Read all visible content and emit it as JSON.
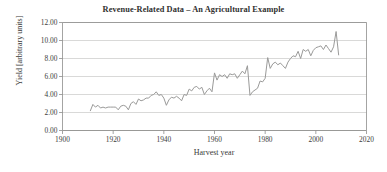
{
  "chart_data": {
    "type": "line",
    "title": "Revenue-Related Data – An Agricultural Example",
    "xlabel": "Harvest year",
    "ylabel": "Yield [arbitrary units]",
    "xlim": [
      1900,
      2020
    ],
    "ylim": [
      0,
      12
    ],
    "xticks": [
      1900,
      1920,
      1940,
      1960,
      1980,
      2000,
      2020
    ],
    "xtick_labels": [
      "1900",
      "1920",
      "1940",
      "1960",
      "1980",
      "2000",
      "2020"
    ],
    "yticks": [
      0,
      2,
      4,
      6,
      8,
      10,
      12
    ],
    "ytick_labels": [
      "0.00",
      "2.00",
      "4.00",
      "6.00",
      "8.00",
      "10.00",
      "12.00"
    ],
    "grid": "horizontal",
    "legend": null,
    "line_color": "#9a9a99",
    "grid_color": "#c9c9c7",
    "axis_color": "#8d8d8b",
    "text_color": "#33332f",
    "series": [
      {
        "name": "Yield",
        "x": [
          1911,
          1912,
          1913,
          1914,
          1915,
          1916,
          1917,
          1918,
          1919,
          1920,
          1921,
          1922,
          1923,
          1924,
          1925,
          1926,
          1927,
          1928,
          1929,
          1930,
          1931,
          1932,
          1933,
          1934,
          1935,
          1936,
          1937,
          1938,
          1939,
          1940,
          1941,
          1942,
          1943,
          1944,
          1945,
          1946,
          1947,
          1948,
          1949,
          1950,
          1951,
          1952,
          1953,
          1954,
          1955,
          1956,
          1957,
          1958,
          1959,
          1960,
          1961,
          1962,
          1963,
          1964,
          1965,
          1966,
          1967,
          1968,
          1969,
          1970,
          1971,
          1972,
          1973,
          1974,
          1975,
          1976,
          1977,
          1978,
          1979,
          1980,
          1981,
          1982,
          1983,
          1984,
          1985,
          1986,
          1987,
          1988,
          1989,
          1990,
          1991,
          1992,
          1993,
          1994,
          1995,
          1996,
          1997,
          1998,
          1999,
          2000,
          2001,
          2002,
          2003,
          2004,
          2005,
          2006,
          2007,
          2008,
          2009
        ],
        "values": [
          2.2,
          2.9,
          2.6,
          2.8,
          2.5,
          2.6,
          2.5,
          2.6,
          2.6,
          2.6,
          2.6,
          2.3,
          2.7,
          2.8,
          2.7,
          2.3,
          3.0,
          3.2,
          2.9,
          3.5,
          3.3,
          3.4,
          3.6,
          3.6,
          3.9,
          4.0,
          4.3,
          3.9,
          4.0,
          3.6,
          2.8,
          3.4,
          3.7,
          3.6,
          3.8,
          3.6,
          3.3,
          4.0,
          3.9,
          4.6,
          4.4,
          4.8,
          4.9,
          4.6,
          4.8,
          4.0,
          4.4,
          4.7,
          4.3,
          6.4,
          5.6,
          6.2,
          6.0,
          6.2,
          5.8,
          6.3,
          6.2,
          6.3,
          5.8,
          6.2,
          6.6,
          6.3,
          7.2,
          3.9,
          4.3,
          4.5,
          4.7,
          5.5,
          5.4,
          5.8,
          8.1,
          6.9,
          7.4,
          7.6,
          7.3,
          7.5,
          7.2,
          6.9,
          7.6,
          8.0,
          8.3,
          8.2,
          8.8,
          8.0,
          9.0,
          8.8,
          9.0,
          8.3,
          8.9,
          9.2,
          9.3,
          9.4,
          9.0,
          9.5,
          9.1,
          8.7,
          9.3,
          11.0,
          8.4
        ]
      }
    ]
  },
  "axis_titles": {
    "x": "Harvest year",
    "y": "Yield [arbitrary units]"
  }
}
